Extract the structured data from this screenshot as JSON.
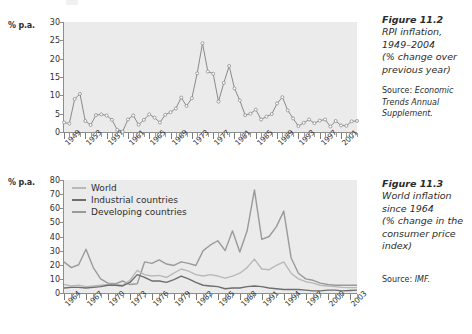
{
  "page": {
    "background": "#ffffff",
    "width": 472,
    "height": 334
  },
  "figure_11_2": {
    "caption_title_lines": [
      "Figure 11.2",
      "RPI inflation,",
      "1949–2004",
      "(% change over",
      "previous year)"
    ],
    "source_prefix": "Source: ",
    "source_italic": "Economic Trends Annual Supplement.",
    "axis_label": "% p.a."
  },
  "figure_11_3": {
    "caption_title_lines": [
      "Figure 11.3",
      "World inflation",
      "since 1964",
      "(% change in the",
      "consumer price",
      "index)"
    ],
    "source_prefix": "Source: ",
    "source_italic": "IMF.",
    "axis_label": "% p.a."
  },
  "colors": {
    "plot_bg": "#ebebeb",
    "axis": "#8d8d8d",
    "line_rpi": "#8a8a8a",
    "marker_rpi": "#ffffff",
    "series_world": "#b9b9b9",
    "series_industrial": "#6e6e6e",
    "series_developing": "#9a9a9a",
    "text": "#2e2e2e"
  },
  "chart_data": [
    {
      "id": "rpi-inflation",
      "type": "line",
      "title": "RPI inflation, 1949–2004 (% change over previous year)",
      "xlabel": "",
      "ylabel": "% p.a.",
      "ylim": [
        0,
        30
      ],
      "yticks": [
        0,
        5,
        10,
        15,
        20,
        25,
        30
      ],
      "xlim": [
        1949,
        2004
      ],
      "xticks_labeled": [
        1949,
        1953,
        1957,
        1961,
        1965,
        1969,
        1973,
        1977,
        1981,
        1985,
        1989,
        1993,
        1997,
        2001
      ],
      "tick_interval_years": 1,
      "grid": false,
      "legend": null,
      "markers": true,
      "x": [
        1949,
        1950,
        1951,
        1952,
        1953,
        1954,
        1955,
        1956,
        1957,
        1958,
        1959,
        1960,
        1961,
        1962,
        1963,
        1964,
        1965,
        1966,
        1967,
        1968,
        1969,
        1970,
        1971,
        1972,
        1973,
        1974,
        1975,
        1976,
        1977,
        1978,
        1979,
        1980,
        1981,
        1982,
        1983,
        1984,
        1985,
        1986,
        1987,
        1988,
        1989,
        1990,
        1991,
        1992,
        1993,
        1994,
        1995,
        1996,
        1997,
        1998,
        1999,
        2000,
        2001,
        2002,
        2003,
        2004
      ],
      "values": [
        2.6,
        2.3,
        9.0,
        10.4,
        3.0,
        1.9,
        4.6,
        4.8,
        4.5,
        3.3,
        0.6,
        0.1,
        3.4,
        4.5,
        2.0,
        3.3,
        4.8,
        3.9,
        2.6,
        4.7,
        5.4,
        6.4,
        9.4,
        7.1,
        9.2,
        16.0,
        24.2,
        16.5,
        15.9,
        8.3,
        13.4,
        18.0,
        11.9,
        8.6,
        4.6,
        5.0,
        6.1,
        3.4,
        4.2,
        4.9,
        7.8,
        9.5,
        5.9,
        3.7,
        1.6,
        2.5,
        3.4,
        2.4,
        3.1,
        3.4,
        1.5,
        3.0,
        1.8,
        1.7,
        2.9,
        3.0
      ]
    },
    {
      "id": "world-inflation",
      "type": "line",
      "title": "World inflation since 1964 (% change in the consumer price index)",
      "xlabel": "",
      "ylabel": "% p.a.",
      "ylim": [
        0,
        80
      ],
      "yticks": [
        0,
        10,
        20,
        30,
        40,
        50,
        60,
        70,
        80
      ],
      "xlim": [
        1964,
        2004
      ],
      "xticks_labeled": [
        1964,
        1967,
        1970,
        1973,
        1976,
        1979,
        1982,
        1985,
        1988,
        1991,
        1994,
        1997,
        2000,
        2003
      ],
      "tick_interval_years": 1,
      "grid": false,
      "legend": [
        "World",
        "Industrial countries",
        "Developing countries"
      ],
      "legend_position": "top-left",
      "markers": false,
      "x": [
        1964,
        1965,
        1966,
        1967,
        1968,
        1969,
        1970,
        1971,
        1972,
        1973,
        1974,
        1975,
        1976,
        1977,
        1978,
        1979,
        1980,
        1981,
        1982,
        1983,
        1984,
        1985,
        1986,
        1987,
        1988,
        1989,
        1990,
        1991,
        1992,
        1993,
        1994,
        1995,
        1996,
        1997,
        1998,
        1999,
        2000,
        2001,
        2002,
        2003,
        2004
      ],
      "series": [
        {
          "name": "World",
          "values": [
            6.0,
            5.0,
            5.5,
            4.5,
            5.0,
            5.5,
            6.0,
            6.0,
            5.5,
            9.0,
            16.0,
            13.0,
            12.0,
            12.5,
            11.0,
            14.0,
            17.0,
            15.5,
            13.0,
            12.0,
            13.0,
            12.0,
            10.5,
            12.0,
            14.0,
            18.0,
            24.0,
            17.0,
            16.5,
            19.5,
            22.0,
            14.0,
            10.0,
            8.0,
            7.0,
            5.5,
            5.0,
            4.5,
            4.0,
            3.8,
            3.8
          ]
        },
        {
          "name": "Industrial countries",
          "values": [
            3.5,
            4.0,
            4.0,
            3.5,
            4.0,
            4.5,
            5.5,
            5.5,
            5.0,
            7.5,
            13.0,
            11.0,
            8.5,
            8.5,
            7.5,
            9.5,
            12.0,
            10.0,
            7.5,
            5.5,
            5.0,
            4.5,
            3.0,
            3.5,
            3.5,
            4.5,
            5.0,
            4.5,
            3.5,
            3.0,
            2.5,
            2.5,
            2.5,
            2.0,
            1.5,
            1.5,
            2.0,
            2.0,
            1.5,
            1.8,
            2.0
          ]
        },
        {
          "name": "Developing countries",
          "values": [
            22.0,
            18.0,
            20.0,
            31.0,
            18.0,
            10.0,
            7.0,
            6.5,
            8.5,
            6.0,
            6.5,
            22.0,
            21.0,
            23.5,
            20.5,
            19.5,
            22.0,
            21.0,
            19.5,
            30.0,
            34.0,
            37.0,
            30.0,
            44.0,
            29.0,
            44.0,
            73.0,
            38.0,
            40.0,
            47.0,
            58.0,
            25.0,
            14.0,
            10.0,
            9.0,
            7.0,
            6.0,
            5.5,
            5.5,
            5.5,
            5.5
          ]
        }
      ]
    }
  ]
}
